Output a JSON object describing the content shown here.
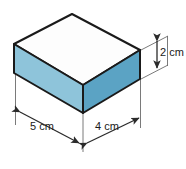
{
  "figure": {
    "name": "rectangular-prism-with-dimensions",
    "shape_type": "rectangular prism",
    "background_color": "#ffffff",
    "colors": {
      "top_face": "#fdfdfd",
      "left_face": "#8ec4da",
      "front_face": "#5ba3c4",
      "outline": "#1a1a1a",
      "dimension_line": "#4a4a4a",
      "label_text": "#1a1a1a"
    },
    "dimensions": [
      {
        "id": "height",
        "label": "2 cm",
        "value": 2,
        "unit": "cm",
        "axis": "vertical",
        "position": "right"
      },
      {
        "id": "length",
        "label": "5 cm",
        "value": 5,
        "unit": "cm",
        "axis": "depth-left",
        "position": "bottom-left"
      },
      {
        "id": "width",
        "label": "4 cm",
        "value": 4,
        "unit": "cm",
        "axis": "depth-right",
        "position": "bottom-right"
      }
    ],
    "vertices": {
      "top_back": [
        72,
        14
      ],
      "top_left": [
        14,
        44
      ],
      "top_right": [
        140,
        50
      ],
      "top_front": [
        83,
        85
      ],
      "bottom_left": [
        14,
        73
      ],
      "bottom_right": [
        140,
        79
      ],
      "bottom_front": [
        83,
        113
      ]
    }
  }
}
